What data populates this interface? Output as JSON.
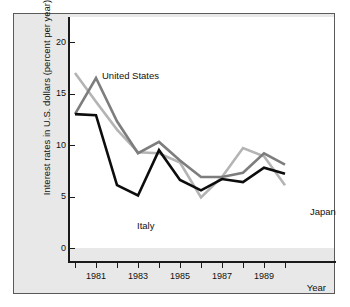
{
  "chart_data": {
    "type": "line",
    "title": "",
    "subtitle": "",
    "xlabel": "Year",
    "ylabel": "Interest rates in U.S. dollars (percent per year)",
    "x": [
      1980,
      1981,
      1982,
      1983,
      1984,
      1985,
      1986,
      1987,
      1988,
      1989,
      1990
    ],
    "xlim": [
      1980,
      1990
    ],
    "ylim": [
      0,
      22
    ],
    "yticks": [
      0,
      5,
      10,
      15,
      20
    ],
    "ytick_labels": [
      "0",
      "5",
      "10",
      "15",
      "20"
    ],
    "xticks": [
      1981,
      1983,
      1985,
      1987,
      1989
    ],
    "xtick_labels": [
      "1981",
      "1983",
      "1985",
      "1987",
      "1989"
    ],
    "xticks_minor": [
      1980,
      1982,
      1984,
      1986,
      1988,
      1990
    ],
    "grid": false,
    "legend": "inline-annotations",
    "series": [
      {
        "name": "United States",
        "color": "#7d7d7d",
        "values": [
          13.0,
          16.5,
          12.3,
          9.2,
          10.3,
          8.5,
          6.9,
          6.9,
          7.3,
          9.2,
          8.1
        ]
      },
      {
        "name": "Italy",
        "color": "#b4b4b4",
        "values": [
          17.0,
          14.2,
          11.5,
          9.3,
          9.2,
          8.3,
          4.9,
          6.9,
          9.7,
          8.9,
          6.1
        ]
      },
      {
        "name": "Japan",
        "color": "#0d0d0d",
        "values": [
          13.0,
          12.9,
          6.1,
          5.1,
          9.5,
          6.6,
          5.6,
          6.7,
          6.4,
          7.8,
          7.2
        ]
      }
    ],
    "annotations": [
      {
        "text": "United States",
        "x_px": 88,
        "y_px": 57
      },
      {
        "text": "Italy",
        "x_px": 123,
        "y_px": 207
      },
      {
        "text": "Japan",
        "x_px": 296,
        "y_px": 193
      }
    ]
  },
  "axis": {
    "y_title": "Interest rates in U.S. dollars (percent per year)",
    "x_title": "Year",
    "y_ticks": [
      "20",
      "15",
      "10",
      "5",
      "0"
    ],
    "x_ticks": [
      "1981",
      "1983",
      "1985",
      "1987",
      "1989"
    ]
  },
  "series_labels": {
    "united_states": "United States",
    "italy": "Italy",
    "japan": "Japan"
  },
  "colors": {
    "united_states": "#7d7d7d",
    "italy": "#b4b4b4",
    "japan": "#0d0d0d",
    "panel_background": "#e8e8e8",
    "plot_background": "#ffffff",
    "axis": "#1a1a1a",
    "border": "#5a5a5a"
  }
}
